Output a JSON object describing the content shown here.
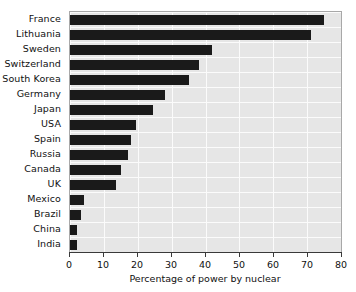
{
  "chart_data": {
    "type": "bar",
    "orientation": "horizontal",
    "title": "",
    "xlabel": "Percentage of power by nuclear",
    "ylabel": "",
    "xlim": [
      0,
      80
    ],
    "ylim": null,
    "xticks": [
      0,
      10,
      20,
      30,
      40,
      50,
      60,
      70,
      80
    ],
    "grid": true,
    "legend": null,
    "categories": [
      "France",
      "Lithuania",
      "Sweden",
      "Switzerland",
      "South Korea",
      "Germany",
      "Japan",
      "USA",
      "Spain",
      "Russia",
      "Canada",
      "UK",
      "Mexico",
      "Brazil",
      "China",
      "India"
    ],
    "values": [
      75,
      71,
      42,
      38,
      35,
      28,
      24.5,
      19.5,
      18,
      17,
      15,
      13.5,
      4,
      3.3,
      2.2,
      2
    ]
  },
  "style": {
    "bar_color": "#1a1a1a",
    "plot_background": "#e6e6e6",
    "gridline_color": "#fbfbfb",
    "axis_color": "#3a3a3a",
    "page_background": "#ffffff",
    "text_color": "#101010"
  }
}
